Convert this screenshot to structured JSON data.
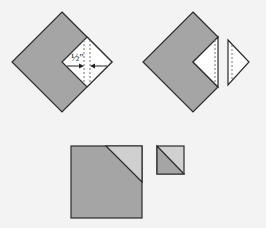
{
  "diagram": {
    "colors": {
      "background": "#f3f3f3",
      "fabric_dark": "#a5a5a5",
      "fabric_light": "#d0d0d0",
      "white_piece": "#ffffff",
      "stroke": "#2b2b2b"
    },
    "step1": {
      "seam_allowance_label": "½\"",
      "description": "Large dark square on point with small white square sewn at right corner; stitching line with 1/2 inch seam allowance indicated by arrows"
    },
    "step2": {
      "description": "Trim along cut line; excess triangle removed and shown separated to the right"
    },
    "step3": {
      "description": "Resulting squares: large square with light triangle at top-right corner, and small half-square triangle unit"
    }
  }
}
